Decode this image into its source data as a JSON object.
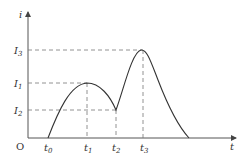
{
  "diagram": {
    "type": "current-time graph",
    "axes": {
      "y_label": "i",
      "x_label": "t",
      "origin_label": "O"
    },
    "y_levels": [
      {
        "id": "I1",
        "base": "I",
        "sub": "1"
      },
      {
        "id": "I2",
        "base": "I",
        "sub": "2"
      },
      {
        "id": "I3",
        "base": "I",
        "sub": "3"
      }
    ],
    "x_marks": [
      {
        "id": "t0",
        "base": "t",
        "sub": "0"
      },
      {
        "id": "t1",
        "base": "t",
        "sub": "1"
      },
      {
        "id": "t2",
        "base": "t",
        "sub": "2"
      },
      {
        "id": "t3",
        "base": "t",
        "sub": "3"
      }
    ],
    "curve_description": "Current rises from 0 at t0 to local max I1 at t1, falls to I2 at t2, rises sharply to max I3 at t3, then decays to 0"
  }
}
